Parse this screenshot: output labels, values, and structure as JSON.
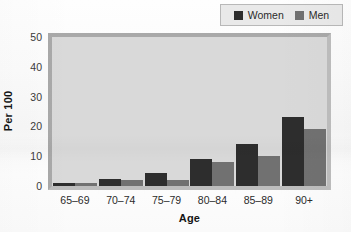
{
  "chart_data": {
    "type": "bar",
    "title": "",
    "subtitle": "",
    "xlabel": "Age",
    "ylabel": "Per 100",
    "categories": [
      "65–69",
      "70–74",
      "75–79",
      "80–84",
      "85–89",
      "90+"
    ],
    "series": [
      {
        "name": "Women",
        "color": "#2d2d2d",
        "values": [
          1,
          2.5,
          4.5,
          9,
          14,
          23
        ]
      },
      {
        "name": "Men",
        "color": "#717171",
        "values": [
          1,
          2,
          2,
          8,
          10,
          19
        ]
      }
    ],
    "ylim": [
      0,
      50
    ],
    "yticks": [
      0,
      10,
      20,
      30,
      40,
      50
    ],
    "ytick_labels": [
      "0",
      "10",
      "20",
      "30",
      "40",
      "50"
    ],
    "grid": false,
    "legend_position": "top-right",
    "legend_entries": [
      "Women",
      "Men"
    ],
    "plot_background": "#d9d9d9",
    "page_background": "#fdfdfd"
  },
  "legend": {
    "items": [
      {
        "label": "Women",
        "swatch_icon": "legend-swatch-square"
      },
      {
        "label": "Men",
        "swatch_icon": "legend-swatch-square"
      }
    ]
  },
  "axes": {
    "y": {
      "title": "Per 100",
      "ticks": [
        "50",
        "40",
        "30",
        "20",
        "10",
        "0"
      ]
    },
    "x": {
      "title": "Age",
      "ticks": [
        "65–69",
        "70–74",
        "75–79",
        "80–84",
        "85–89",
        "90+"
      ]
    }
  }
}
